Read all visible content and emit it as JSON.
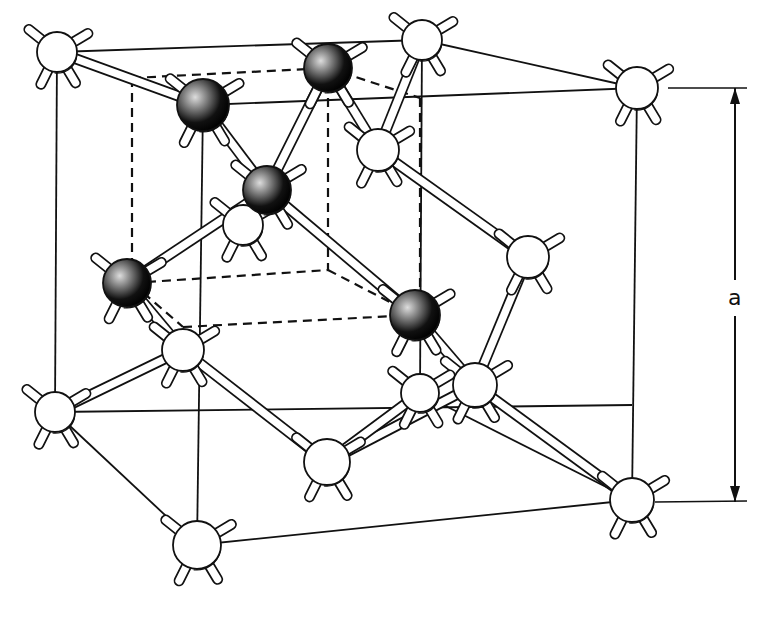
{
  "figure": {
    "dimension_label": "a",
    "colors": {
      "ink": "#111111",
      "background": "#ffffff",
      "dark_atom": "#1a1a1a",
      "light_atom": "#ffffff"
    }
  },
  "atoms": {
    "light": [
      {
        "id": "c1",
        "x": 57,
        "y": 52,
        "r": 20
      },
      {
        "id": "c2",
        "x": 422,
        "y": 40,
        "r": 20
      },
      {
        "id": "c3",
        "x": 637,
        "y": 88,
        "r": 21
      },
      {
        "id": "c4",
        "x": 55,
        "y": 412,
        "r": 20
      },
      {
        "id": "c5",
        "x": 197,
        "y": 545,
        "r": 24
      },
      {
        "id": "c6",
        "x": 632,
        "y": 500,
        "r": 22
      },
      {
        "id": "f1",
        "x": 378,
        "y": 150,
        "r": 21
      },
      {
        "id": "f2",
        "x": 528,
        "y": 257,
        "r": 21
      },
      {
        "id": "f3",
        "x": 183,
        "y": 350,
        "r": 21
      },
      {
        "id": "f4",
        "x": 327,
        "y": 462,
        "r": 23
      },
      {
        "id": "f5",
        "x": 475,
        "y": 385,
        "r": 22
      },
      {
        "id": "f6",
        "x": 420,
        "y": 393,
        "r": 19
      },
      {
        "id": "f7",
        "x": 243,
        "y": 225,
        "r": 20
      }
    ],
    "dark": [
      {
        "id": "d1",
        "x": 203,
        "y": 105,
        "r": 26
      },
      {
        "id": "d2",
        "x": 328,
        "y": 68,
        "r": 24
      },
      {
        "id": "d3",
        "x": 267,
        "y": 190,
        "r": 24
      },
      {
        "id": "d4",
        "x": 127,
        "y": 283,
        "r": 24
      },
      {
        "id": "d5",
        "x": 415,
        "y": 315,
        "r": 25
      }
    ]
  },
  "bonds": [
    [
      "d3",
      "d1"
    ],
    [
      "d3",
      "d2"
    ],
    [
      "d3",
      "d4"
    ],
    [
      "d3",
      "d5"
    ],
    [
      "d2",
      "f1"
    ],
    [
      "c2",
      "f1"
    ],
    [
      "f1",
      "f2"
    ],
    [
      "d1",
      "c1"
    ],
    [
      "f2",
      "f5"
    ],
    [
      "d5",
      "f5"
    ],
    [
      "f5",
      "c6"
    ],
    [
      "f5",
      "f4"
    ],
    [
      "d4",
      "f3"
    ],
    [
      "f3",
      "c4"
    ],
    [
      "f3",
      "f4"
    ],
    [
      "f6",
      "f4"
    ],
    [
      "d3",
      "f7"
    ]
  ],
  "cell_lines": {
    "solid": [
      [
        57,
        52,
        422,
        40
      ],
      [
        422,
        40,
        637,
        88
      ],
      [
        57,
        52,
        203,
        105
      ],
      [
        203,
        105,
        637,
        88
      ],
      [
        55,
        412,
        632,
        405
      ],
      [
        55,
        412,
        197,
        545
      ],
      [
        197,
        545,
        632,
        500
      ],
      [
        420,
        393,
        632,
        500
      ],
      [
        57,
        52,
        55,
        412
      ],
      [
        203,
        105,
        197,
        545
      ],
      [
        637,
        88,
        632,
        500
      ],
      [
        422,
        40,
        420,
        393
      ]
    ],
    "dashed": [
      [
        132,
        78,
        328,
        68
      ],
      [
        328,
        68,
        420,
        98
      ],
      [
        132,
        78,
        132,
        283
      ],
      [
        328,
        68,
        328,
        270
      ],
      [
        420,
        98,
        420,
        315
      ],
      [
        132,
        283,
        328,
        270
      ],
      [
        328,
        270,
        415,
        315
      ],
      [
        183,
        327,
        415,
        315
      ],
      [
        132,
        283,
        183,
        327
      ]
    ]
  },
  "dimension": {
    "x": 735,
    "y_top": 88,
    "y_bottom": 502,
    "label_y": 298
  }
}
